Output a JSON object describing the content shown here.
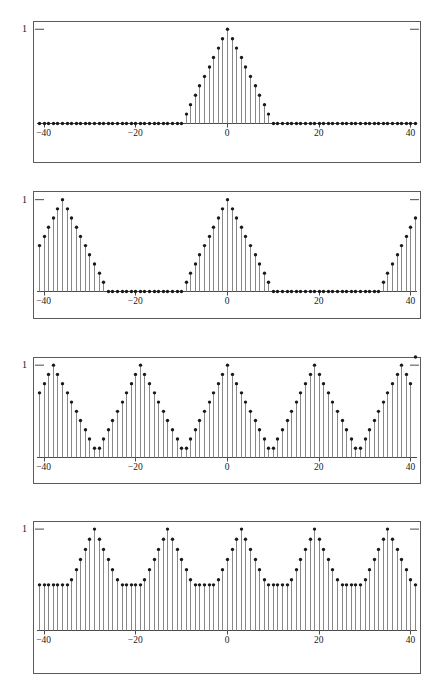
{
  "figure": {
    "background_color": "#ffffff",
    "frame_color": "#5a5a5a",
    "stem_color": "#7a7a7a",
    "marker_color": "#1a1a1a",
    "axis_color": "#4a4a4a",
    "panel_count": 4
  },
  "axes": {
    "x_min": -41,
    "x_max": 41,
    "x_ticks": [
      -40,
      -20,
      0,
      20,
      40
    ],
    "x_tick_labels": [
      "−40",
      "−20",
      "0",
      "20",
      "40"
    ],
    "y_min": 0,
    "y_max": 1.22,
    "y_ticks": [
      1
    ],
    "y_tick_labels": [
      "1"
    ]
  },
  "chart_data": [
    {
      "type": "line",
      "title": "",
      "subtitle": "Aperiodic triangular pulse",
      "xlabel": "",
      "ylabel": "",
      "xlim": [
        -41,
        41
      ],
      "ylim": [
        0,
        1.22
      ],
      "grid": false,
      "legend": "none",
      "period": null,
      "pulse_half_width": 10,
      "peak_value": 1,
      "baseline_value": 0,
      "x": [
        -41,
        -40,
        -39,
        -38,
        -37,
        -36,
        -35,
        -34,
        -33,
        -32,
        -31,
        -30,
        -29,
        -28,
        -27,
        -26,
        -25,
        -24,
        -23,
        -22,
        -21,
        -20,
        -19,
        -18,
        -17,
        -16,
        -15,
        -14,
        -13,
        -12,
        -11,
        -10,
        -9,
        -8,
        -7,
        -6,
        -5,
        -4,
        -3,
        -2,
        -1,
        0,
        1,
        2,
        3,
        4,
        5,
        6,
        7,
        8,
        9,
        10,
        11,
        12,
        13,
        14,
        15,
        16,
        17,
        18,
        19,
        20,
        21,
        22,
        23,
        24,
        25,
        26,
        27,
        28,
        29,
        30,
        31,
        32,
        33,
        34,
        35,
        36,
        37,
        38,
        39,
        40,
        41
      ],
      "values": [
        0,
        0,
        0,
        0,
        0,
        0,
        0,
        0,
        0,
        0,
        0,
        0,
        0,
        0,
        0,
        0,
        0,
        0,
        0,
        0,
        0,
        0,
        0,
        0,
        0,
        0,
        0,
        0,
        0,
        0,
        0,
        0,
        0.1,
        0.2,
        0.3,
        0.4,
        0.5,
        0.6,
        0.7,
        0.8,
        0.9,
        1,
        0.9,
        0.8,
        0.7,
        0.6,
        0.5,
        0.4,
        0.3,
        0.2,
        0.1,
        0,
        0,
        0,
        0,
        0,
        0,
        0,
        0,
        0,
        0,
        0,
        0,
        0,
        0,
        0,
        0,
        0,
        0,
        0,
        0,
        0,
        0,
        0,
        0,
        0,
        0,
        0,
        0,
        0,
        0,
        0,
        0
      ]
    },
    {
      "type": "line",
      "title": "",
      "subtitle": "Periodic extension, period 35",
      "xlabel": "",
      "ylabel": "",
      "xlim": [
        -41,
        41
      ],
      "ylim": [
        0,
        1.22
      ],
      "grid": false,
      "legend": "none",
      "period": 35,
      "pulse_half_width": 10,
      "peak_value": 1,
      "baseline_value": 0,
      "x": [
        -41,
        -40,
        -39,
        -38,
        -37,
        -36,
        -35,
        -34,
        -33,
        -32,
        -31,
        -30,
        -29,
        -28,
        -27,
        -26,
        -25,
        -24,
        -23,
        -22,
        -21,
        -20,
        -19,
        -18,
        -17,
        -16,
        -15,
        -14,
        -13,
        -12,
        -11,
        -10,
        -9,
        -8,
        -7,
        -6,
        -5,
        -4,
        -3,
        -2,
        -1,
        0,
        1,
        2,
        3,
        4,
        5,
        6,
        7,
        8,
        9,
        10,
        11,
        12,
        13,
        14,
        15,
        16,
        17,
        18,
        19,
        20,
        21,
        22,
        23,
        24,
        25,
        26,
        27,
        28,
        29,
        30,
        31,
        32,
        33,
        34,
        35,
        36,
        37,
        38,
        39,
        40,
        41
      ],
      "values": [
        0.5,
        0.6,
        0.7,
        0.8,
        0.9,
        1,
        0.9,
        0.8,
        0.7,
        0.6,
        0.5,
        0.4,
        0.3,
        0.2,
        0.1,
        0,
        0,
        0,
        0,
        0,
        0,
        0,
        0,
        0,
        0,
        0,
        0,
        0,
        0,
        0,
        0,
        0,
        0.1,
        0.2,
        0.3,
        0.4,
        0.5,
        0.6,
        0.7,
        0.8,
        0.9,
        1,
        0.9,
        0.8,
        0.7,
        0.6,
        0.5,
        0.4,
        0.3,
        0.2,
        0.1,
        0,
        0,
        0,
        0,
        0,
        0,
        0,
        0,
        0,
        0,
        0,
        0,
        0,
        0,
        0,
        0,
        0,
        0,
        0,
        0,
        0,
        0,
        0,
        0,
        0.1,
        0.2,
        0.3,
        0.4,
        0.5,
        0.6,
        0.7,
        0.8,
        0.9,
        1,
        0.9,
        0.8,
        0.7,
        0.6
      ]
    },
    {
      "type": "line",
      "title": "",
      "subtitle": "Periodic extension, period 19",
      "xlabel": "",
      "ylabel": "",
      "xlim": [
        -41,
        41
      ],
      "ylim": [
        0,
        1.22
      ],
      "grid": false,
      "legend": "none",
      "period": 19,
      "pulse_half_width": 10,
      "peak_value": 1,
      "baseline_value": 0.1,
      "x": [
        -41,
        -40,
        -39,
        -38,
        -37,
        -36,
        -35,
        -34,
        -33,
        -32,
        -31,
        -30,
        -29,
        -28,
        -27,
        -26,
        -25,
        -24,
        -23,
        -22,
        -21,
        -20,
        -19,
        -18,
        -17,
        -16,
        -15,
        -14,
        -13,
        -12,
        -11,
        -10,
        -9,
        -8,
        -7,
        -6,
        -5,
        -4,
        -3,
        -2,
        -1,
        0,
        1,
        2,
        3,
        4,
        5,
        6,
        7,
        8,
        9,
        10,
        11,
        12,
        13,
        14,
        15,
        16,
        17,
        18,
        19,
        20,
        21,
        22,
        23,
        24,
        25,
        26,
        27,
        28,
        29,
        30,
        31,
        32,
        33,
        34,
        35,
        36,
        37,
        38,
        39,
        40,
        41
      ],
      "values": [
        0.7,
        0.8,
        0.9,
        1,
        0.9,
        0.8,
        0.7,
        0.6,
        0.5,
        0.4,
        0.3,
        0.2,
        0.1,
        0.1,
        0.2,
        0.3,
        0.4,
        0.5,
        0.6,
        0.7,
        0.8,
        0.9,
        1,
        0.9,
        0.8,
        0.7,
        0.6,
        0.5,
        0.4,
        0.3,
        0.2,
        0.1,
        0.1,
        0.2,
        0.3,
        0.4,
        0.5,
        0.6,
        0.7,
        0.8,
        0.9,
        1,
        0.9,
        0.8,
        0.7,
        0.6,
        0.5,
        0.4,
        0.3,
        0.2,
        0.1,
        0.1,
        0.2,
        0.3,
        0.4,
        0.5,
        0.6,
        0.7,
        0.8,
        0.9,
        1,
        0.9,
        0.8,
        0.7,
        0.6,
        0.5,
        0.4,
        0.3,
        0.2,
        0.1,
        0.1,
        0.2,
        0.3,
        0.4,
        0.5,
        0.6,
        0.7,
        0.8,
        0.9,
        1,
        0.9,
        0.8
      ]
    },
    {
      "type": "line",
      "title": "",
      "subtitle": "Periodic extension, period 15",
      "xlabel": "",
      "ylabel": "",
      "xlim": [
        -41,
        41
      ],
      "ylim": [
        0,
        1.22
      ],
      "grid": false,
      "legend": "none",
      "period": 15,
      "pulse_half_width": 10,
      "peak_value": 1,
      "baseline_value": 0.45,
      "x": [
        -41,
        -40,
        -39,
        -38,
        -37,
        -36,
        -35,
        -34,
        -33,
        -32,
        -31,
        -30,
        -29,
        -28,
        -27,
        -26,
        -25,
        -24,
        -23,
        -22,
        -21,
        -20,
        -19,
        -18,
        -17,
        -16,
        -15,
        -14,
        -13,
        -12,
        -11,
        -10,
        -9,
        -8,
        -7,
        -6,
        -5,
        -4,
        -3,
        -2,
        -1,
        0,
        1,
        2,
        3,
        4,
        5,
        6,
        7,
        8,
        9,
        10,
        11,
        12,
        13,
        14,
        15,
        16,
        17,
        18,
        19,
        20,
        21,
        22,
        23,
        24,
        25,
        26,
        27,
        28,
        29,
        30,
        31,
        32,
        33,
        34,
        35,
        36,
        37,
        38,
        39,
        40,
        41
      ],
      "values": [
        0.45,
        0.45,
        0.45,
        0.45,
        0.45,
        0.45,
        0.45,
        0.5,
        0.6,
        0.7,
        0.8,
        0.9,
        1,
        0.9,
        0.8,
        0.7,
        0.6,
        0.5,
        0.45,
        0.45,
        0.45,
        0.45,
        0.45,
        0.5,
        0.6,
        0.7,
        0.8,
        0.9,
        1,
        0.9,
        0.8,
        0.7,
        0.6,
        0.5,
        0.45,
        0.45,
        0.45,
        0.45,
        0.45,
        0.5,
        0.6,
        0.7,
        0.8,
        0.9,
        1,
        0.9,
        0.8,
        0.7,
        0.6,
        0.5,
        0.45,
        0.45,
        0.45,
        0.45,
        0.45,
        0.5,
        0.6,
        0.7,
        0.8,
        0.9,
        1,
        0.9,
        0.8,
        0.7,
        0.6,
        0.5,
        0.45,
        0.45,
        0.45,
        0.45,
        0.45,
        0.5,
        0.6,
        0.7,
        0.8,
        0.9,
        1,
        0.9,
        0.8,
        0.7,
        0.6,
        0.5,
        0.45
      ]
    }
  ],
  "panel_geometry": [
    {
      "top": 21,
      "height": 142,
      "axis_y_frac": 0.72
    },
    {
      "top": 191,
      "height": 128,
      "axis_y_frac": 0.78
    },
    {
      "top": 357,
      "height": 127,
      "axis_y_frac": 0.79
    },
    {
      "top": 521,
      "height": 153,
      "axis_y_frac": 0.715
    }
  ]
}
